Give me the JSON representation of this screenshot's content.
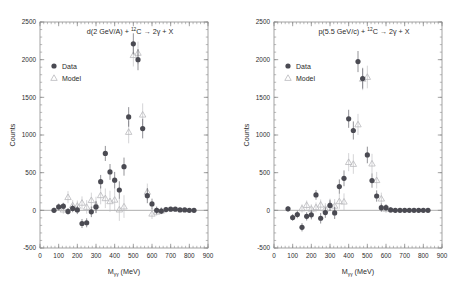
{
  "figure": {
    "background": "#ffffff",
    "data_color": "#4a4a52",
    "model_color": "#b9b9bd",
    "axis_color": "#8d8d8d",
    "text_color": "#2b2b2b",
    "panels": [
      "left",
      "right"
    ]
  },
  "legend": {
    "data_label": "Data",
    "model_label": "Model",
    "data_marker": "filled-circle",
    "model_marker": "open-triangle"
  },
  "chart_data": [
    {
      "id": "left",
      "type": "scatter",
      "title": "d(2 GeV/A) + ¹²C → 2γ + X",
      "title_parts": {
        "pre": "d(2 GeV/A) + ",
        "sup": "12",
        "mid": "C → 2",
        "gamma": "γ",
        "post": " + X"
      },
      "xlabel": "Mγγ (MeV)",
      "xlabel_parts": {
        "base": "M",
        "sub": "γγ",
        "unit": " (MeV)"
      },
      "ylabel": "Counts",
      "xlim": [
        0,
        900
      ],
      "ylim": [
        -500,
        2500
      ],
      "xticks": [
        0,
        100,
        200,
        300,
        400,
        500,
        600,
        700,
        800,
        900
      ],
      "yticks": [
        -500,
        0,
        500,
        1000,
        1500,
        2000,
        2500
      ],
      "xminor_step": 20,
      "yminor_step": 100,
      "grid": false,
      "zero_line": true,
      "series": [
        {
          "name": "Data",
          "marker": "filled-circle",
          "color": "#4a4a52",
          "x": [
            75,
            100,
            125,
            150,
            175,
            200,
            225,
            250,
            275,
            300,
            325,
            350,
            375,
            400,
            425,
            450,
            475,
            500,
            525,
            550,
            575,
            600,
            625,
            650,
            675,
            700,
            725,
            750,
            775,
            800,
            825
          ],
          "y": [
            0,
            45,
            55,
            -15,
            25,
            5,
            -175,
            -165,
            -20,
            45,
            380,
            755,
            510,
            400,
            270,
            580,
            1240,
            2210,
            2000,
            1085,
            195,
            85,
            0,
            -10,
            10,
            15,
            15,
            5,
            5,
            0,
            0
          ],
          "yerr": [
            35,
            45,
            45,
            45,
            50,
            55,
            60,
            60,
            70,
            80,
            90,
            100,
            105,
            110,
            115,
            120,
            130,
            140,
            140,
            130,
            100,
            70,
            50,
            40,
            35,
            30,
            25,
            20,
            20,
            15,
            15
          ]
        },
        {
          "name": "Model",
          "marker": "open-triangle",
          "color": "#b9b9bd",
          "x": [
            125,
            150,
            175,
            200,
            225,
            250,
            275,
            300,
            325,
            350,
            375,
            400,
            425,
            450,
            475,
            500,
            525,
            550,
            575,
            600,
            625,
            650
          ],
          "y": [
            10,
            175,
            65,
            60,
            100,
            45,
            135,
            70,
            200,
            160,
            120,
            140,
            10,
            50,
            1040,
            2060,
            2090,
            1270,
            245,
            -45,
            -20,
            -5
          ],
          "yerr": [
            55,
            80,
            70,
            70,
            85,
            90,
            100,
            110,
            120,
            130,
            140,
            150,
            150,
            150,
            150,
            150,
            150,
            150,
            110,
            70,
            50,
            40
          ]
        }
      ]
    },
    {
      "id": "right",
      "type": "scatter",
      "title": "p(5.5 GeV/c) + ¹²C → 2γ + X",
      "title_parts": {
        "pre": "p(5.5 GeV/c) + ",
        "sup": "12",
        "mid": "C → 2",
        "gamma": "γ",
        "post": " + X"
      },
      "xlabel": "Mγγ (MeV)",
      "xlabel_parts": {
        "base": "M",
        "sub": "γγ",
        "unit": " (MeV)"
      },
      "ylabel": "Counts",
      "xlim": [
        0,
        900
      ],
      "ylim": [
        -500,
        2500
      ],
      "xticks": [
        0,
        100,
        200,
        300,
        400,
        500,
        600,
        700,
        800,
        900
      ],
      "yticks": [
        -500,
        0,
        500,
        1000,
        1500,
        2000,
        2500
      ],
      "xminor_step": 20,
      "yminor_step": 100,
      "grid": false,
      "zero_line": true,
      "series": [
        {
          "name": "Data",
          "marker": "filled-circle",
          "color": "#4a4a52",
          "x": [
            75,
            100,
            125,
            150,
            175,
            200,
            225,
            250,
            275,
            300,
            325,
            350,
            375,
            400,
            425,
            450,
            475,
            500,
            525,
            550,
            575,
            600,
            625,
            650,
            675,
            700,
            725,
            750,
            775,
            800,
            825
          ],
          "y": [
            20,
            -95,
            -55,
            -225,
            -80,
            -60,
            205,
            -105,
            -30,
            65,
            -35,
            315,
            425,
            1215,
            1060,
            1975,
            1750,
            735,
            395,
            190,
            35,
            35,
            5,
            0,
            0,
            0,
            0,
            0,
            0,
            0,
            0
          ],
          "yerr": [
            35,
            45,
            50,
            55,
            55,
            60,
            65,
            70,
            70,
            75,
            80,
            95,
            105,
            120,
            120,
            140,
            135,
            110,
            95,
            75,
            55,
            45,
            35,
            30,
            25,
            20,
            20,
            15,
            15,
            15,
            15
          ]
        },
        {
          "name": "Model",
          "marker": "open-triangle",
          "color": "#b9b9bd",
          "x": [
            150,
            175,
            200,
            225,
            250,
            275,
            300,
            325,
            350,
            375,
            400,
            425,
            450,
            475,
            500,
            525,
            550,
            575,
            600
          ],
          "y": [
            25,
            70,
            20,
            40,
            75,
            20,
            75,
            60,
            120,
            115,
            640,
            615,
            1140,
            1745,
            1770,
            620,
            400,
            155,
            20
          ],
          "yerr": [
            55,
            60,
            60,
            65,
            70,
            75,
            80,
            90,
            100,
            110,
            120,
            130,
            140,
            150,
            150,
            130,
            110,
            80,
            55
          ]
        }
      ]
    }
  ]
}
